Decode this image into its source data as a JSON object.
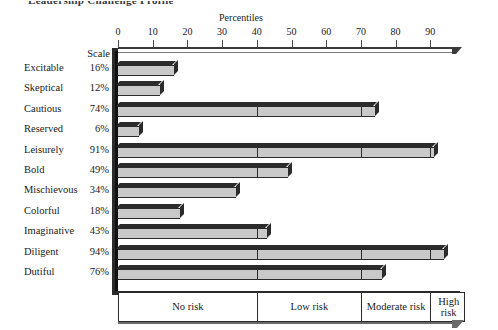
{
  "page": {
    "title": "Leadership Challenge Profile"
  },
  "chart_data": {
    "type": "bar",
    "title": "Percentiles",
    "xlabel": "Percentiles",
    "ylabel": "",
    "orientation": "horizontal",
    "xlim": [
      0,
      100
    ],
    "grid": false,
    "scale_header": "Scale",
    "tick_labels": [
      "0",
      "10",
      "20",
      "30",
      "40",
      "50",
      "60",
      "70",
      "80",
      "90"
    ],
    "tick_values": [
      0,
      10,
      20,
      30,
      40,
      50,
      60,
      70,
      80,
      90
    ],
    "categories": [
      "Excitable",
      "Skeptical",
      "Cautious",
      "Reserved",
      "Leisurely",
      "Bold",
      "Mischievous",
      "Colorful",
      "Imaginative",
      "Diligent",
      "Dutiful"
    ],
    "values": [
      16,
      12,
      74,
      6,
      91,
      49,
      34,
      18,
      43,
      94,
      76
    ],
    "value_labels": [
      "16%",
      "12%",
      "74%",
      "6%",
      "91%",
      "49%",
      "34%",
      "18%",
      "43%",
      "94%",
      "76%"
    ],
    "risk_bands": [
      {
        "label": "No risk",
        "start": 0,
        "end": 40
      },
      {
        "label": "Low risk",
        "start": 40,
        "end": 70
      },
      {
        "label": "Moderate risk",
        "start": 70,
        "end": 90
      },
      {
        "label": "High risk",
        "start": 90,
        "end": 100
      }
    ],
    "colors": {
      "bar_fill": "#c9c9c9",
      "bar_edge": "#2b2b2b",
      "text": "#1a1a1a",
      "axis": "#3a3a3a"
    }
  }
}
